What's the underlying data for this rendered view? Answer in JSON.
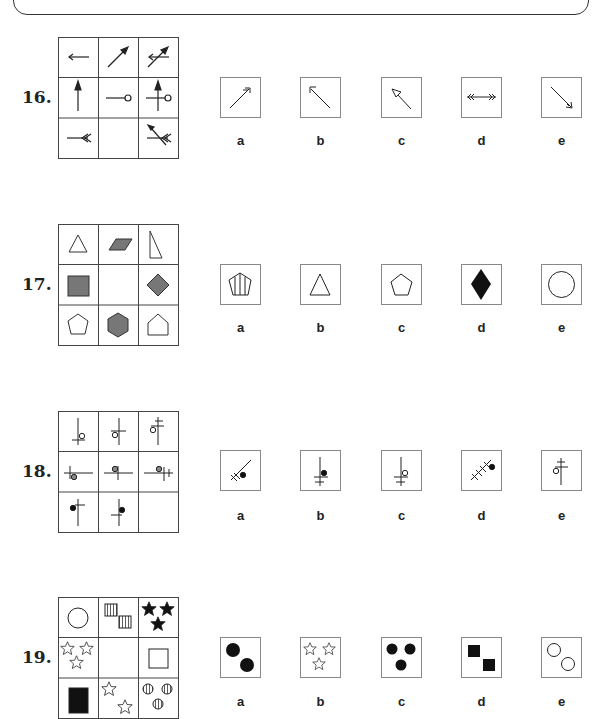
{
  "header": {
    "visible": "partial rounded frame"
  },
  "questions": [
    {
      "number": "16.",
      "options": [
        "a",
        "b",
        "c",
        "d",
        "e"
      ]
    },
    {
      "number": "17.",
      "options": [
        "a",
        "b",
        "c",
        "d",
        "e"
      ]
    },
    {
      "number": "18.",
      "options": [
        "a",
        "b",
        "c",
        "d",
        "e"
      ]
    },
    {
      "number": "19.",
      "options": [
        "a",
        "b",
        "c",
        "d",
        "e"
      ]
    }
  ],
  "colors": {
    "line": "#333333",
    "gray_fill": "#777777",
    "black_fill": "#111111",
    "border": "#888888"
  }
}
